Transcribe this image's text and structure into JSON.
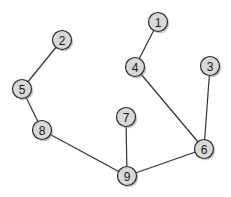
{
  "diagram": {
    "type": "undirected-graph",
    "node_radius": 9.5,
    "colors": {
      "background": "#ffffff",
      "node_fill": "#d8d8d8",
      "node_stroke": "#2a2a2a",
      "edge": "#333333",
      "label": "#1a1a1a"
    },
    "nodes": [
      {
        "id": "1",
        "label": "1",
        "x": 158,
        "y": 22
      },
      {
        "id": "2",
        "label": "2",
        "x": 62,
        "y": 40
      },
      {
        "id": "3",
        "label": "3",
        "x": 210,
        "y": 66
      },
      {
        "id": "4",
        "label": "4",
        "x": 135,
        "y": 67
      },
      {
        "id": "5",
        "label": "5",
        "x": 22,
        "y": 89
      },
      {
        "id": "6",
        "label": "6",
        "x": 204,
        "y": 149
      },
      {
        "id": "7",
        "label": "7",
        "x": 126,
        "y": 117
      },
      {
        "id": "8",
        "label": "8",
        "x": 42,
        "y": 130
      },
      {
        "id": "9",
        "label": "9",
        "x": 127,
        "y": 176
      }
    ],
    "edges": [
      {
        "from": "1",
        "to": "4"
      },
      {
        "from": "2",
        "to": "5"
      },
      {
        "from": "5",
        "to": "8"
      },
      {
        "from": "8",
        "to": "9"
      },
      {
        "from": "7",
        "to": "9"
      },
      {
        "from": "9",
        "to": "6"
      },
      {
        "from": "4",
        "to": "6"
      },
      {
        "from": "3",
        "to": "6"
      }
    ]
  }
}
